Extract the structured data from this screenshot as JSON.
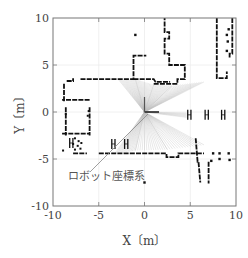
{
  "chart_data": {
    "type": "scatter",
    "title": "",
    "xlabel": "X〔m〕",
    "ylabel": "Y〔m〕",
    "xlim": [
      -10,
      10
    ],
    "ylim": [
      -10,
      10
    ],
    "xticks": [
      "-10",
      "-5",
      "0",
      "5",
      "10"
    ],
    "yticks": [
      "-10",
      "-5",
      "0",
      "5",
      "10"
    ],
    "grid": true,
    "legend": null,
    "annotations": [
      {
        "text": "ロボット座標系",
        "x": -7.3,
        "y": -6.0,
        "arrow_to": [
          0.3,
          -0.2
        ]
      }
    ],
    "robot_origin": [
      0,
      0
    ],
    "robot_axes": {
      "x_axis_end": [
        1.6,
        0
      ],
      "y_axis_end": [
        0,
        1.6
      ]
    },
    "laser_fan": {
      "description": "Grey laser rays from robot origin forming two wedges (upper-left/right and lower-left/right)",
      "rays_end_points_upper": [
        [
          -2.8,
          3.4
        ],
        [
          -1.0,
          3.5
        ],
        [
          1.0,
          2.9
        ],
        [
          3.0,
          2.8
        ],
        [
          6.5,
          3.2
        ]
      ],
      "rays_end_points_lower": [
        [
          -3.3,
          -4.5
        ],
        [
          -1.0,
          -4.1
        ],
        [
          2.5,
          -4.0
        ],
        [
          6.5,
          -3.5
        ]
      ]
    },
    "series": [
      {
        "name": "occupancy_walls",
        "description": "Black laser scan points forming environment map (walls/obstacles)",
        "segments": [
          {
            "points": [
              [
                -8.5,
                3.3
              ],
              [
                -7.8,
                3.3
              ],
              [
                -7.8,
                3.6
              ]
            ]
          },
          {
            "points": [
              [
                -7.0,
                3.5
              ],
              [
                -1.2,
                3.5
              ],
              [
                -1.2,
                6.0
              ],
              [
                0.2,
                6.0
              ]
            ]
          },
          {
            "points": [
              [
                -1.2,
                3.5
              ],
              [
                1.0,
                3.5
              ],
              [
                1.2,
                3.2
              ],
              [
                2.8,
                3.2
              ]
            ]
          },
          {
            "points": [
              [
                1.0,
                3.0
              ],
              [
                3.6,
                3.0
              ],
              [
                3.6,
                3.5
              ],
              [
                4.4,
                3.5
              ],
              [
                4.4,
                5.0
              ],
              [
                2.7,
                5.0
              ],
              [
                2.7,
                6.2
              ],
              [
                2.2,
                6.2
              ],
              [
                2.2,
                7.8
              ],
              [
                2.7,
                7.8
              ],
              [
                2.7,
                8.5
              ],
              [
                2.2,
                8.5
              ],
              [
                2.2,
                10
              ]
            ]
          },
          {
            "points": [
              [
                7.9,
                10
              ],
              [
                7.9,
                3.6
              ],
              [
                9.0,
                3.6
              ],
              [
                9.0,
                4.2
              ],
              [
                8.9,
                4.2
              ]
            ]
          },
          {
            "points": [
              [
                9.6,
                10
              ],
              [
                9.6,
                6.2
              ],
              [
                9.3,
                6.2
              ],
              [
                9.3,
                5.8
              ]
            ]
          },
          {
            "points": [
              [
                -6.0,
                1.3
              ],
              [
                -9.0,
                1.3
              ]
            ]
          },
          {
            "points": [
              [
                -8.8,
                3.0
              ],
              [
                -8.8,
                1.0
              ]
            ]
          },
          {
            "points": [
              [
                -8.6,
                0.5
              ],
              [
                -8.6,
                -2.5
              ]
            ]
          },
          {
            "points": [
              [
                -6.0,
                0.5
              ],
              [
                -6.0,
                -2.5
              ]
            ]
          },
          {
            "points": [
              [
                -9.0,
                -2.3
              ],
              [
                -6.0,
                -2.3
              ]
            ]
          },
          {
            "points": [
              [
                -7.8,
                -4.4
              ],
              [
                -6.3,
                -4.4
              ]
            ]
          },
          {
            "points": [
              [
                -5.0,
                -4.4
              ],
              [
                2.4,
                -4.4
              ],
              [
                2.4,
                -4.8
              ],
              [
                3.7,
                -4.8
              ],
              [
                3.7,
                -4.4
              ],
              [
                6.5,
                -4.4
              ]
            ]
          },
          {
            "points": [
              [
                5.6,
                -2.8
              ],
              [
                5.8,
                -5.3
              ],
              [
                5.9,
                -5.3
              ],
              [
                6.1,
                -7.5
              ]
            ]
          },
          {
            "points": [
              [
                7.0,
                -5.3
              ],
              [
                7.0,
                -7.6
              ]
            ]
          }
        ],
        "markers_H": [
          [
            4.9,
            -0.3
          ],
          [
            6.8,
            -0.3
          ],
          [
            8.6,
            -0.3
          ],
          [
            -3.4,
            -3.4
          ],
          [
            -2.0,
            -3.4
          ],
          [
            -8.0,
            -3.3
          ]
        ],
        "scattered_points": [
          [
            -1.0,
            8.2
          ],
          [
            9.2,
            8.8
          ],
          [
            9.0,
            8.2
          ],
          [
            9.1,
            7.5
          ],
          [
            9.0,
            6.5
          ],
          [
            7.5,
            -4.4
          ],
          [
            8.2,
            -4.4
          ],
          [
            9.2,
            -4.4
          ],
          [
            7.3,
            -5.2
          ],
          [
            8.2,
            -5.0
          ],
          [
            9.3,
            -5.1
          ],
          [
            0.0,
            -7.5
          ]
        ]
      }
    ]
  }
}
